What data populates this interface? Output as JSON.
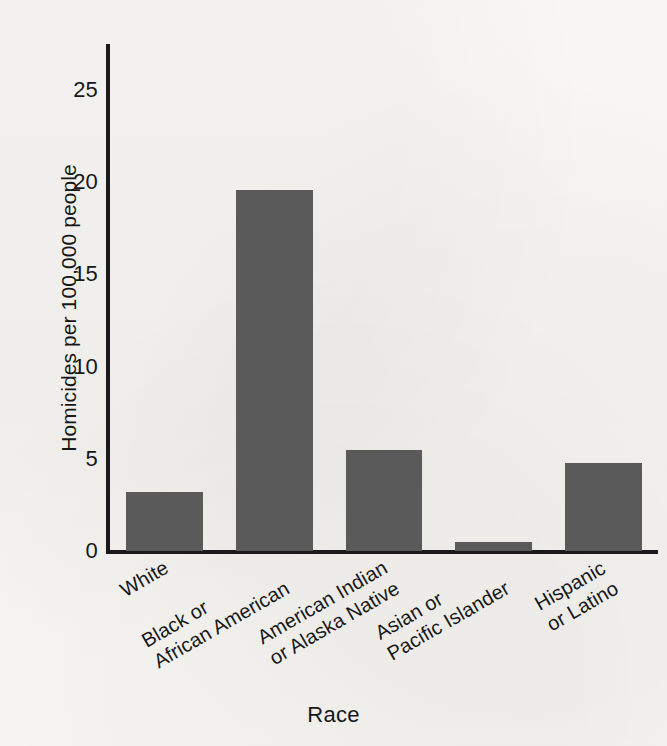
{
  "chart_data": {
    "type": "bar",
    "title": "",
    "subtitle": "",
    "xlabel": "Race",
    "ylabel": "Homicides per 100,000 people",
    "categories": [
      "White",
      "Black or African American",
      "American Indian or Alaska Native",
      "Asian or Pacific Islander",
      "Hispanic or Latino"
    ],
    "category_lines": [
      [
        "White"
      ],
      [
        "Black or",
        "African American"
      ],
      [
        "American Indian",
        "or Alaska Native"
      ],
      [
        "Asian or",
        "Pacific Islander"
      ],
      [
        "Hispanic",
        "or Latino"
      ]
    ],
    "values": [
      3.2,
      19.6,
      5.5,
      0.5,
      4.8
    ],
    "ylim": [
      0,
      27.5
    ],
    "yticks": [
      0,
      5,
      10,
      15,
      20,
      25
    ],
    "ytick_labels": [
      "0",
      "5",
      "10",
      "15",
      "20",
      "25"
    ],
    "grid": false,
    "legend": null,
    "bar_color": "#5a5a5a",
    "axis_color": "#1a1a1a",
    "background_color": "#f7f6f3",
    "xtick_rotation_deg": -30
  }
}
